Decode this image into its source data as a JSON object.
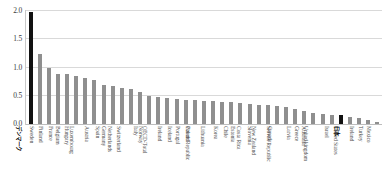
{
  "chart_data": {
    "type": "bar",
    "title": "",
    "subtitle": "",
    "xlabel": "",
    "ylabel": "",
    "ylim": [
      0.0,
      2.0
    ],
    "ytick_labels": [
      "0.0",
      "0.5",
      "1.0",
      "1.5",
      "2.0"
    ],
    "ytick_values": [
      0.0,
      0.5,
      1.0,
      1.5,
      2.0
    ],
    "grid": true,
    "legend": "none",
    "bar_color": "#8f8f8f",
    "highlight_color": "#111111",
    "highlighted_categories": [
      "デンマーク",
      "日本"
    ],
    "categories": [
      "デンマーク",
      "Sweden",
      "Finland",
      "France",
      "Belgium",
      "Hungary",
      "Luxembourg",
      "Austria",
      "Spain",
      "Germany",
      "Netherlands",
      "Switzerland",
      "Italy",
      "Norway",
      "OECD-Total",
      "Ireland",
      "Iceland",
      "Portugal",
      "Poland",
      "Czech Republic",
      "Lithuania",
      "Korea",
      "Chile",
      "Estonia",
      "Costa Rica",
      "Slovenia",
      "New Zealand",
      "Canada",
      "Slovak Republic",
      "Latvia",
      "Greece",
      "Australia",
      "United kingdom",
      "Israel",
      "日本",
      "United States",
      "Ireland",
      "Turkey",
      "Mexico"
    ],
    "values": [
      1.97,
      1.23,
      0.99,
      0.88,
      0.88,
      0.85,
      0.8,
      0.78,
      0.69,
      0.67,
      0.63,
      0.62,
      0.57,
      0.49,
      0.48,
      0.45,
      0.44,
      0.43,
      0.42,
      0.41,
      0.4,
      0.39,
      0.38,
      0.36,
      0.35,
      0.34,
      0.33,
      0.31,
      0.29,
      0.26,
      0.22,
      0.2,
      0.17,
      0.16,
      0.15,
      0.12,
      0.1,
      0.07,
      0.04
    ]
  }
}
